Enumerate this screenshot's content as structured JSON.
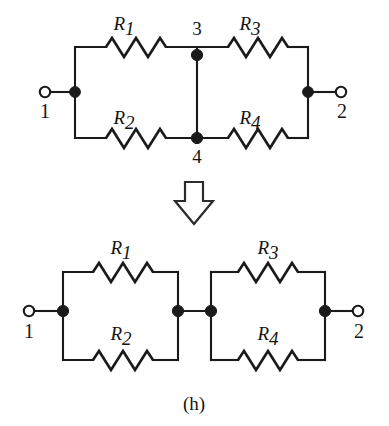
{
  "figure": {
    "caption": "(h)",
    "top_circuit": {
      "name": "bridge-network-before",
      "terminals": [
        {
          "id": "terminal-1",
          "label": "1",
          "type": "open-terminal",
          "x": 45,
          "y": 92
        },
        {
          "id": "terminal-2",
          "label": "2",
          "type": "open-terminal",
          "x": 341,
          "y": 92
        }
      ],
      "nodes": [
        {
          "id": "node-3",
          "label": "3",
          "type": "junction-dot",
          "x": 197,
          "y": 55
        },
        {
          "id": "node-4",
          "label": "4",
          "type": "junction-dot",
          "x": 197,
          "y": 138
        },
        {
          "id": "node-left",
          "label": "",
          "type": "junction-dot",
          "x": 75,
          "y": 92
        },
        {
          "id": "node-right",
          "label": "",
          "type": "junction-dot",
          "x": 308,
          "y": 92
        }
      ],
      "resistors": [
        {
          "id": "resistor-r1",
          "label": "R",
          "subscript": "1",
          "position": "top-left"
        },
        {
          "id": "resistor-r2",
          "label": "R",
          "subscript": "2",
          "position": "bottom-left"
        },
        {
          "id": "resistor-r3",
          "label": "R",
          "subscript": "3",
          "position": "top-right"
        },
        {
          "id": "resistor-r4",
          "label": "R",
          "subscript": "4",
          "position": "bottom-right"
        }
      ]
    },
    "transform_arrow": {
      "name": "down-arrow",
      "direction": "down",
      "style": "hollow-outline"
    },
    "bottom_circuit": {
      "name": "series-parallel-after",
      "terminals": [
        {
          "id": "terminal-1",
          "label": "1",
          "type": "open-terminal",
          "x": 29,
          "y": 311
        },
        {
          "id": "terminal-2",
          "label": "2",
          "type": "open-terminal",
          "x": 358,
          "y": 311
        }
      ],
      "nodes": [
        {
          "id": "node-left",
          "label": "",
          "type": "junction-dot",
          "x": 63,
          "y": 311
        },
        {
          "id": "node-mid-left",
          "label": "",
          "type": "junction-dot",
          "x": 178,
          "y": 311
        },
        {
          "id": "node-mid-right",
          "label": "",
          "type": "junction-dot",
          "x": 211,
          "y": 311
        },
        {
          "id": "node-right",
          "label": "",
          "type": "junction-dot",
          "x": 325,
          "y": 311
        }
      ],
      "resistors": [
        {
          "id": "resistor-r1",
          "label": "R",
          "subscript": "1",
          "position": "top-left"
        },
        {
          "id": "resistor-r2",
          "label": "R",
          "subscript": "2",
          "position": "bottom-left"
        },
        {
          "id": "resistor-r3",
          "label": "R",
          "subscript": "3",
          "position": "top-right"
        },
        {
          "id": "resistor-r4",
          "label": "R",
          "subscript": "4",
          "position": "bottom-right"
        }
      ]
    }
  },
  "labels": {
    "r1": "R",
    "r1_sub": "1",
    "r2": "R",
    "r2_sub": "2",
    "r3": "R",
    "r3_sub": "3",
    "r4": "R",
    "r4_sub": "4",
    "node3": "3",
    "node4": "4",
    "terminal1": "1",
    "terminal2": "2",
    "caption": "(h)"
  },
  "colors": {
    "ink": "#1a1a1a",
    "background": "#ffffff"
  }
}
